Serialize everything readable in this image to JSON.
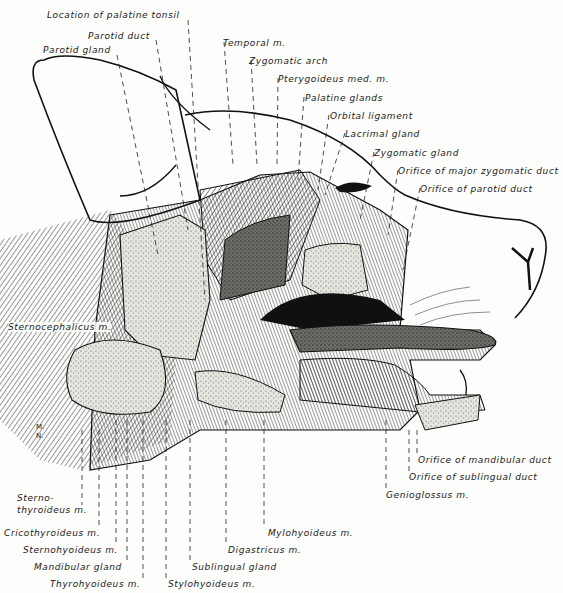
{
  "figure": {
    "signature": [
      "M.",
      "N."
    ]
  },
  "labels": {
    "top": [
      {
        "id": "palatine-tonsil",
        "text": "Location of palatine tonsil",
        "x": 47,
        "y": 10
      },
      {
        "id": "parotid-duct",
        "text": "Parotid duct",
        "x": 88,
        "y": 31
      },
      {
        "id": "parotid-gland",
        "text": "Parotid gland",
        "x": 43,
        "y": 45
      },
      {
        "id": "temporal-m",
        "text": "Temporal m.",
        "x": 223,
        "y": 38
      },
      {
        "id": "zygomatic-arch",
        "text": "Zygomatic arch",
        "x": 249,
        "y": 56
      },
      {
        "id": "pterygoideus",
        "text": "Pterygoideus med. m.",
        "x": 278,
        "y": 74
      },
      {
        "id": "palatine-glands",
        "text": "Palatine glands",
        "x": 305,
        "y": 93
      },
      {
        "id": "orbital-ligament",
        "text": "Orbital ligament",
        "x": 330,
        "y": 111
      },
      {
        "id": "lacrimal-gland",
        "text": "Lacrimal gland",
        "x": 345,
        "y": 129
      },
      {
        "id": "zygomatic-gland",
        "text": "Zygomatic gland",
        "x": 374,
        "y": 148
      },
      {
        "id": "orifice-major-zygomatic",
        "text": "Orifice of major zygomatic duct",
        "x": 398,
        "y": 166
      },
      {
        "id": "orifice-parotid",
        "text": "Orifice of parotid duct",
        "x": 420,
        "y": 184
      }
    ],
    "left": [
      {
        "id": "sternocephalicus",
        "text": "Sternocephalicus m.",
        "x": 8,
        "y": 322
      }
    ],
    "bottom": [
      {
        "id": "sternothyroideus-1",
        "text": "Sterno-",
        "x": 17,
        "y": 493
      },
      {
        "id": "sternothyroideus-2",
        "text": "thyroideus m.",
        "x": 17,
        "y": 505
      },
      {
        "id": "cricothyroideus",
        "text": "Cricothyroideus m.",
        "x": 4,
        "y": 528
      },
      {
        "id": "sternohyoideus",
        "text": "Sternohyoideus m.",
        "x": 23,
        "y": 545
      },
      {
        "id": "mandibular-gland",
        "text": "Mandibular gland",
        "x": 34,
        "y": 562
      },
      {
        "id": "thyrohyoideus",
        "text": "Thyrohyoideus m.",
        "x": 50,
        "y": 579
      },
      {
        "id": "stylohyoideus",
        "text": "Stylohyoideus m.",
        "x": 168,
        "y": 579
      },
      {
        "id": "sublingual-gland",
        "text": "Sublingual gland",
        "x": 192,
        "y": 562
      },
      {
        "id": "digastricus",
        "text": "Digastricus m.",
        "x": 228,
        "y": 545
      },
      {
        "id": "mylohyoideus",
        "text": "Mylohyoideus m.",
        "x": 268,
        "y": 528
      }
    ],
    "right": [
      {
        "id": "orifice-mandibular",
        "text": "Orifice of mandibular duct",
        "x": 418,
        "y": 455
      },
      {
        "id": "orifice-sublingual",
        "text": "Orifice of sublingual duct",
        "x": 409,
        "y": 472
      },
      {
        "id": "genioglossus",
        "text": "Genioglossus m.",
        "x": 386,
        "y": 490
      }
    ]
  },
  "colors": {
    "ink": "#1a1a1a",
    "paper": "#fdfdfc",
    "gland_fill": "#d8d6cf",
    "muscle_fill": "#9a9892",
    "dark_cavity": "#101010"
  }
}
